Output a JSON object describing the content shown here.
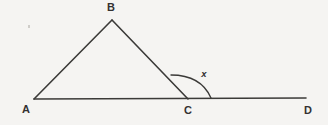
{
  "figure": {
    "background_color": "#f5f4f2",
    "stroke_color": "#3b3a38",
    "label_color": "#333131",
    "width": 328,
    "height": 125,
    "labels": {
      "a": "A",
      "b": "B",
      "c": "C",
      "d": "D",
      "x": "x"
    },
    "label_positions": {
      "a": {
        "x": 26,
        "y": 113
      },
      "b": {
        "x": 111,
        "y": 11
      },
      "c": {
        "x": 188,
        "y": 114
      },
      "d": {
        "x": 308,
        "y": 114
      },
      "x": {
        "x": 204,
        "y": 77
      }
    },
    "points": {
      "A": {
        "x": 34,
        "y": 99
      },
      "B": {
        "x": 112,
        "y": 20
      },
      "C": {
        "x": 188,
        "y": 99
      },
      "D": {
        "x": 306,
        "y": 98
      }
    },
    "segments": [
      {
        "name": "segment-ab",
        "from": "A",
        "to": "B"
      },
      {
        "name": "segment-bc",
        "from": "B",
        "to": "C"
      },
      {
        "name": "line-ad",
        "from": "A",
        "to": "D"
      }
    ],
    "angle_arc": {
      "name": "angle-arc-x",
      "vertex": "C",
      "start": {
        "x": 171,
        "y": 75
      },
      "end": {
        "x": 211,
        "y": 98
      },
      "sweep_description": "exterior angle at C between ray CB and ray CD"
    },
    "artifact_speck": {
      "x": 28,
      "y": 25,
      "w": 2,
      "h": 3
    }
  }
}
